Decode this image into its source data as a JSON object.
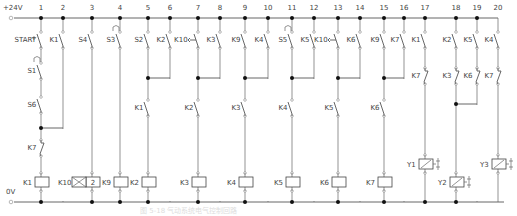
{
  "rails": {
    "top_label": "+24V",
    "bottom_label": "0V",
    "top_y": 18,
    "bottom_y": 202,
    "start_x": 14,
    "end_x": 505
  },
  "rungs": [
    {
      "num": "1",
      "x": 41
    },
    {
      "num": "2",
      "x": 63
    },
    {
      "num": "3",
      "x": 92
    },
    {
      "num": "4",
      "x": 120
    },
    {
      "num": "5",
      "x": 148
    },
    {
      "num": "6",
      "x": 170
    },
    {
      "num": "7",
      "x": 198
    },
    {
      "num": "8",
      "x": 220
    },
    {
      "num": "9",
      "x": 245
    },
    {
      "num": "10",
      "x": 268
    },
    {
      "num": "11",
      "x": 292
    },
    {
      "num": "12",
      "x": 314
    },
    {
      "num": "13",
      "x": 338
    },
    {
      "num": "14",
      "x": 360
    },
    {
      "num": "15",
      "x": 384
    },
    {
      "num": "16",
      "x": 404
    },
    {
      "num": "17",
      "x": 425
    },
    {
      "num": "18",
      "x": 456
    },
    {
      "num": "19",
      "x": 477
    },
    {
      "num": "20",
      "x": 498
    }
  ],
  "contacts": [
    {
      "label": "START",
      "x": 41,
      "y": 40,
      "type": "NO-push"
    },
    {
      "label": "S1",
      "x": 41,
      "y": 71,
      "type": "NC-limit",
      "cam": true
    },
    {
      "label": "S6",
      "x": 41,
      "y": 105,
      "type": "NO"
    },
    {
      "label": "K7",
      "x": 41,
      "y": 148,
      "type": "NC"
    },
    {
      "label": "K1",
      "x": 63,
      "y": 40,
      "type": "NO"
    },
    {
      "label": "S4",
      "x": 92,
      "y": 40,
      "type": "NO"
    },
    {
      "label": "S3",
      "x": 120,
      "y": 40,
      "type": "NC-limit",
      "cam": true
    },
    {
      "label": "S2",
      "x": 148,
      "y": 40,
      "type": "NO"
    },
    {
      "label": "K1",
      "x": 148,
      "y": 108,
      "type": "NO"
    },
    {
      "label": "K2",
      "x": 170,
      "y": 40,
      "type": "NO"
    },
    {
      "label": "K10",
      "x": 198,
      "y": 40,
      "type": "NO-timer"
    },
    {
      "label": "K2",
      "x": 198,
      "y": 108,
      "type": "NO"
    },
    {
      "label": "K3",
      "x": 220,
      "y": 40,
      "type": "NO"
    },
    {
      "label": "K9",
      "x": 245,
      "y": 40,
      "type": "NO"
    },
    {
      "label": "K3",
      "x": 245,
      "y": 108,
      "type": "NO"
    },
    {
      "label": "K4",
      "x": 268,
      "y": 40,
      "type": "NO"
    },
    {
      "label": "S5",
      "x": 292,
      "y": 40,
      "type": "NC-limit",
      "cam": true
    },
    {
      "label": "K4",
      "x": 292,
      "y": 108,
      "type": "NO"
    },
    {
      "label": "K5",
      "x": 314,
      "y": 40,
      "type": "NO"
    },
    {
      "label": "K10",
      "x": 338,
      "y": 40,
      "type": "NO-timer"
    },
    {
      "label": "K5",
      "x": 338,
      "y": 108,
      "type": "NO"
    },
    {
      "label": "K6",
      "x": 360,
      "y": 40,
      "type": "NO"
    },
    {
      "label": "K9",
      "x": 384,
      "y": 40,
      "type": "NO"
    },
    {
      "label": "K6",
      "x": 384,
      "y": 108,
      "type": "NO"
    },
    {
      "label": "K7",
      "x": 404,
      "y": 40,
      "type": "NO"
    },
    {
      "label": "K1",
      "x": 425,
      "y": 40,
      "type": "NO"
    },
    {
      "label": "K7",
      "x": 425,
      "y": 76,
      "type": "NC"
    },
    {
      "label": "K2",
      "x": 456,
      "y": 40,
      "type": "NO"
    },
    {
      "label": "K3",
      "x": 456,
      "y": 76,
      "type": "NC"
    },
    {
      "label": "K5",
      "x": 477,
      "y": 40,
      "type": "NO"
    },
    {
      "label": "K6",
      "x": 477,
      "y": 76,
      "type": "NC"
    },
    {
      "label": "K4",
      "x": 498,
      "y": 40,
      "type": "NO"
    },
    {
      "label": "K7",
      "x": 498,
      "y": 76,
      "type": "NC"
    }
  ],
  "coils": [
    {
      "label": "K1",
      "x": 41,
      "y": 182,
      "type": "relay"
    },
    {
      "label": "K10",
      "x": 92,
      "y": 182,
      "type": "timer",
      "value": "2"
    },
    {
      "label": "K9",
      "x": 120,
      "y": 182,
      "type": "relay"
    },
    {
      "label": "K2",
      "x": 148,
      "y": 182,
      "type": "relay"
    },
    {
      "label": "K3",
      "x": 198,
      "y": 182,
      "type": "relay"
    },
    {
      "label": "K4",
      "x": 245,
      "y": 182,
      "type": "relay"
    },
    {
      "label": "K5",
      "x": 292,
      "y": 182,
      "type": "relay"
    },
    {
      "label": "K6",
      "x": 338,
      "y": 182,
      "type": "relay"
    },
    {
      "label": "K7",
      "x": 384,
      "y": 182,
      "type": "relay"
    },
    {
      "label": "Y1",
      "x": 425,
      "y": 164,
      "type": "solenoid"
    },
    {
      "label": "Y2",
      "x": 456,
      "y": 182,
      "type": "solenoid"
    },
    {
      "label": "Y3",
      "x": 498,
      "y": 164,
      "type": "solenoid"
    }
  ],
  "seal_in_links": [
    {
      "from_x": 41,
      "to_x": 63,
      "y": 128
    },
    {
      "from_x": 148,
      "to_x": 170,
      "y": 78
    },
    {
      "from_x": 198,
      "to_x": 220,
      "y": 78
    },
    {
      "from_x": 245,
      "to_x": 268,
      "y": 78
    },
    {
      "from_x": 292,
      "to_x": 314,
      "y": 78
    },
    {
      "from_x": 338,
      "to_x": 360,
      "y": 78
    },
    {
      "from_x": 384,
      "to_x": 404,
      "y": 78
    },
    {
      "from_x": 456,
      "to_x": 477,
      "y": 104
    }
  ],
  "caption": "图 5-18  气动系统电气控制回路"
}
